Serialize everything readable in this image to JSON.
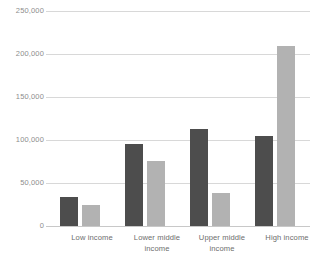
{
  "chart_data": {
    "type": "bar",
    "title": "",
    "subtitle": "",
    "xlabel": "",
    "ylabel": "",
    "categories": [
      "Low income",
      "Lower middle income",
      "Upper middle income",
      "High income"
    ],
    "series": [
      {
        "name": "Series 1",
        "color": "#4d4d4d",
        "values": [
          34000,
          95000,
          113000,
          105000
        ]
      },
      {
        "name": "Series 2",
        "color": "#b2b2b2",
        "values": [
          25000,
          76000,
          39000,
          209000
        ]
      }
    ],
    "ylim": [
      0,
      250000
    ],
    "yticks": [
      0,
      50000,
      100000,
      150000,
      200000,
      250000
    ],
    "ytick_labels": [
      "0",
      "50,000",
      "100,000",
      "150,000",
      "200,000",
      "250,000"
    ],
    "grid": true,
    "legend": "none"
  },
  "axis": {
    "y_labels": [
      "250,000",
      "200,000",
      "150,000",
      "100,000",
      "50,000",
      "0"
    ],
    "x_labels": [
      {
        "line1": "Low income",
        "line2": ""
      },
      {
        "line1": "Lower middle",
        "line2": "income"
      },
      {
        "line1": "Upper middle",
        "line2": "income"
      },
      {
        "line1": "High income",
        "line2": ""
      }
    ]
  },
  "colors": {
    "series_dark": "#4d4d4d",
    "series_light": "#b2b2b2",
    "gridline": "#d8d8d8",
    "tick_text": "#8d8d8d",
    "label_text": "#6d6d6d",
    "background": "#ffffff"
  }
}
